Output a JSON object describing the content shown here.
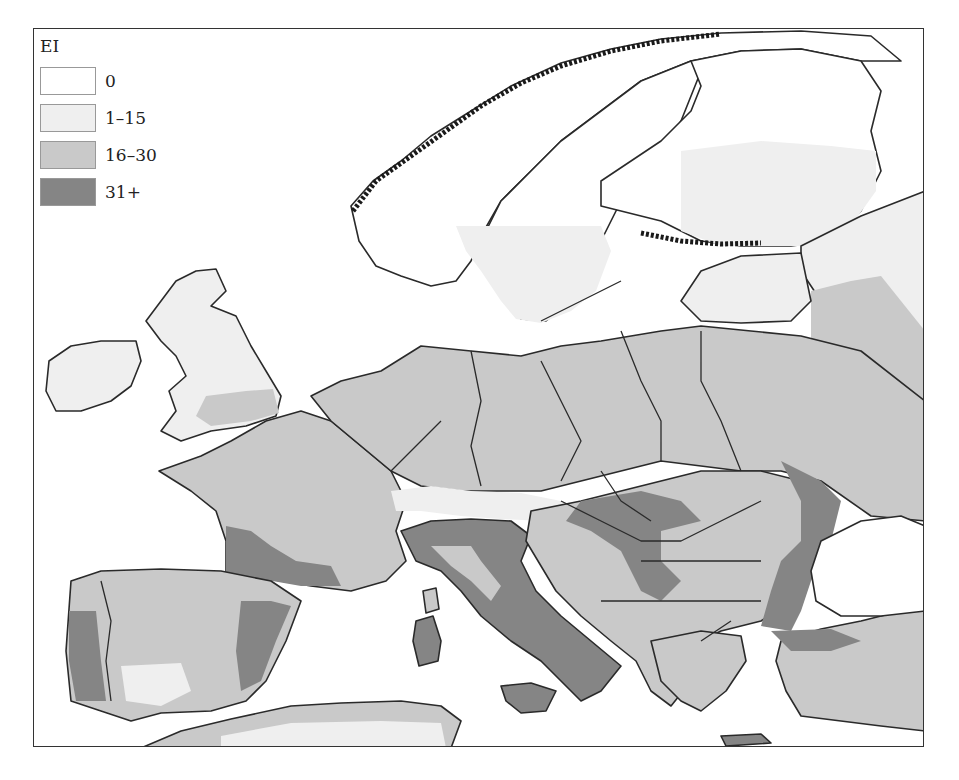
{
  "legend": {
    "title": "EI",
    "classes": [
      {
        "label": "0",
        "color": "#ffffff"
      },
      {
        "label": "1–15",
        "color": "#efefef"
      },
      {
        "label": "16–30",
        "color": "#c9c9c9"
      },
      {
        "label": "31+",
        "color": "#858585"
      }
    ]
  },
  "map": {
    "region": "Europe",
    "variable": "EI",
    "colors": {
      "zero": "#ffffff",
      "low": "#efefef",
      "mid": "#c9c9c9",
      "high": "#858585",
      "border": "#2a2a2a"
    }
  }
}
